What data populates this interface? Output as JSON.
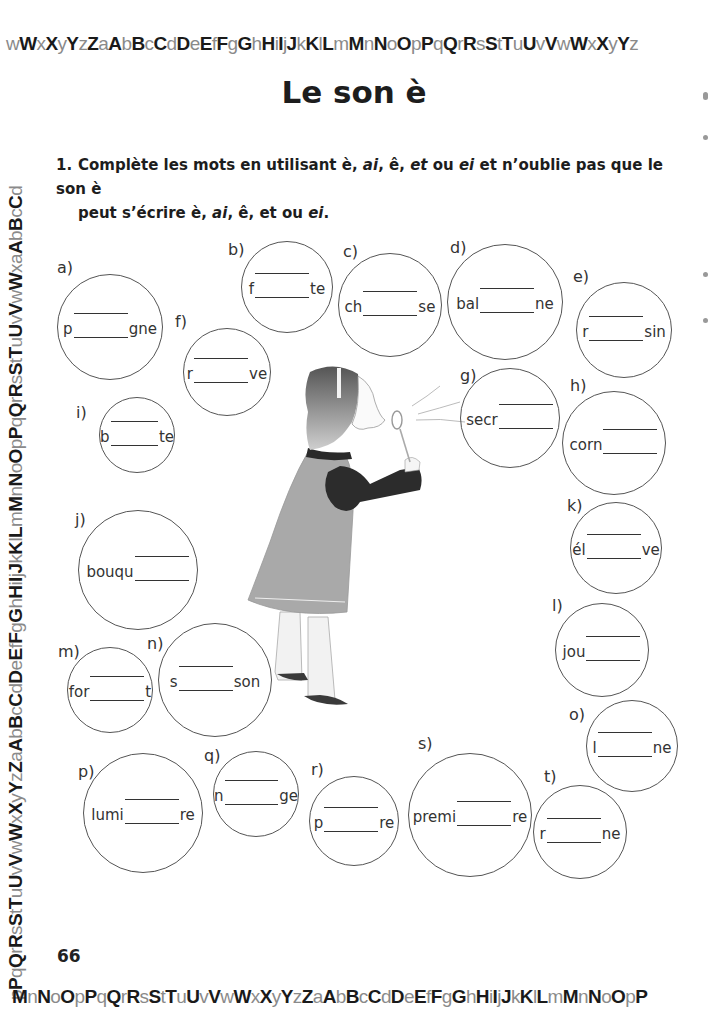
{
  "alphabet_border": {
    "top": "wWxXyYzZaAbBcCdDeEfFgGhHiIjJkKlLmMnNoOpPqQrRsStTuUvVwWxXyYz",
    "bottom": "MnNoOpPqQrRsStTuUvVwWxXyYzZaAbBcCdDeEfFgGhHiIjJkKlLmMnNoOpP",
    "left": "pPqQrRsStTuUvVwWxXyYzZaAbBcCdDeEfFgGhHiIjJkKlLmMnNoOpPqQrRsStTuUvVwWxaAbBcCd"
  },
  "page": {
    "title": "Le son è",
    "page_number": "66"
  },
  "exercise": {
    "number": "1.",
    "instruction_line1_parts": [
      "Complète les mots en utilisant è, ",
      "ai",
      ", ê, ",
      "et",
      " ou ",
      "ei",
      " et n’oublie pas que le son è"
    ],
    "instruction_line2_parts": [
      "peut s’écrire è, ",
      "ai",
      ", ê, et ou ",
      "ei",
      "."
    ]
  },
  "bubbles": [
    {
      "label": "a)",
      "prefix": "p",
      "suffix": "gne"
    },
    {
      "label": "b)",
      "prefix": "f",
      "suffix": "te"
    },
    {
      "label": "c)",
      "prefix": "ch",
      "suffix": "se"
    },
    {
      "label": "d)",
      "prefix": "bal",
      "suffix": "ne"
    },
    {
      "label": "e)",
      "prefix": "r",
      "suffix": "sin"
    },
    {
      "label": "f)",
      "prefix": "r",
      "suffix": "ve"
    },
    {
      "label": "g)",
      "prefix": "secr",
      "suffix": ""
    },
    {
      "label": "h)",
      "prefix": "corn",
      "suffix": ""
    },
    {
      "label": "i)",
      "prefix": "b",
      "suffix": "te"
    },
    {
      "label": "j)",
      "prefix": "bouqu",
      "suffix": ""
    },
    {
      "label": "k)",
      "prefix": "él",
      "suffix": "ve"
    },
    {
      "label": "l)",
      "prefix": "jou",
      "suffix": ""
    },
    {
      "label": "m)",
      "prefix": "for",
      "suffix": "t"
    },
    {
      "label": "n)",
      "prefix": "s",
      "suffix": "son"
    },
    {
      "label": "o)",
      "prefix": "l",
      "suffix": "ne"
    },
    {
      "label": "p)",
      "prefix": "lumi",
      "suffix": "re"
    },
    {
      "label": "q)",
      "prefix": "n",
      "suffix": "ge"
    },
    {
      "label": "r)",
      "prefix": "p",
      "suffix": "re"
    },
    {
      "label": "s)",
      "prefix": "premi",
      "suffix": "re"
    },
    {
      "label": "t)",
      "prefix": "r",
      "suffix": "ne"
    }
  ],
  "illustration": {
    "description": "girl-blowing-bubbles"
  }
}
